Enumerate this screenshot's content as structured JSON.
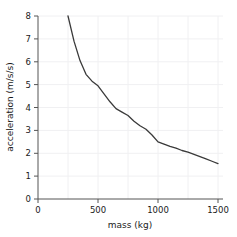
{
  "chart_data": {
    "type": "line",
    "title": "",
    "xlabel": "mass (kg)",
    "ylabel": "acceleration (m/s/s)",
    "xlim": [
      0,
      1550
    ],
    "ylim": [
      0,
      8
    ],
    "xticks": [
      0,
      500,
      1000,
      1500
    ],
    "xtick_labels": [
      "0",
      "500",
      "1000",
      "1500"
    ],
    "yticks": [
      0,
      1,
      2,
      3,
      4,
      5,
      6,
      7,
      8
    ],
    "ytick_labels": [
      "0",
      "1",
      "2",
      "3",
      "4",
      "5",
      "6",
      "7",
      "8"
    ],
    "grid": true,
    "legend": false,
    "series": [
      {
        "name": "acceleration vs mass",
        "color": "#3a3a3a",
        "relation": "a = 2000 / m (inverse proportion)",
        "x": [
          250,
          300,
          350,
          400,
          450,
          500,
          550,
          600,
          650,
          700,
          750,
          800,
          850,
          900,
          950,
          1000,
          1050,
          1100,
          1150,
          1200,
          1250,
          1300,
          1350,
          1400,
          1450,
          1500
        ],
        "y": [
          8.0,
          6.9,
          6.05,
          5.45,
          5.15,
          4.95,
          4.6,
          4.25,
          3.95,
          3.8,
          3.65,
          3.4,
          3.2,
          3.05,
          2.8,
          2.5,
          2.4,
          2.3,
          2.22,
          2.12,
          2.05,
          1.95,
          1.85,
          1.75,
          1.65,
          1.55
        ]
      }
    ]
  },
  "axes": {
    "xlabel": "mass (kg)",
    "ylabel": "acceleration (m/s/s)",
    "xticks": [
      "0",
      "500",
      "1000",
      "1500"
    ],
    "yticks": [
      "8",
      "7",
      "6",
      "5",
      "4",
      "3",
      "2",
      "1",
      "0"
    ]
  }
}
